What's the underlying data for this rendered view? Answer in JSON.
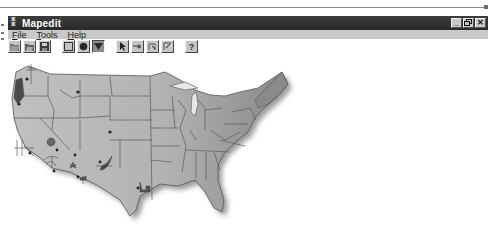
{
  "window": {
    "title": "Mapedit",
    "controls": {
      "minimize": "_",
      "restore": "❐",
      "close": "✕"
    }
  },
  "menu": {
    "items": [
      {
        "label": "File",
        "accel": "F"
      },
      {
        "label": "Tools",
        "accel": "T"
      },
      {
        "label": "Help",
        "accel": "H"
      }
    ]
  },
  "toolbar": {
    "groups": [
      [
        "open-icon",
        "save-as-icon",
        "save-icon"
      ],
      [
        "rectangle-icon",
        "circle-icon",
        "polygon-icon"
      ],
      [
        "pointer-icon",
        "test-icon",
        "move-point-icon",
        "add-point-icon"
      ],
      [
        "help-icon"
      ]
    ]
  },
  "map": {
    "subject": "United States map",
    "colors": {
      "land": "#b9b9b9",
      "land_dark": "#8e8e8e",
      "border": "#5e5e5e",
      "shadow": "#9a9a9a",
      "marker": "#2b2b2b"
    },
    "markers": [
      {
        "name": "washington-marker"
      },
      {
        "name": "oregon-marker"
      },
      {
        "name": "montana-marker"
      },
      {
        "name": "colorado-marker"
      },
      {
        "name": "nevada-marker"
      },
      {
        "name": "arizona-marker"
      },
      {
        "name": "california-marker"
      },
      {
        "name": "texas-marker"
      }
    ]
  }
}
